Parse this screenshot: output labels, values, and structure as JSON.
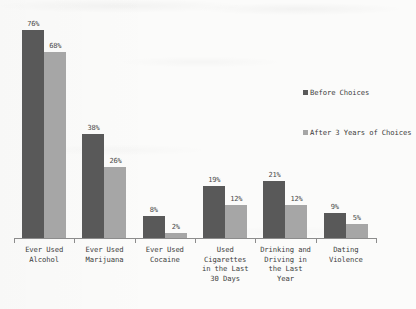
{
  "chart_data": {
    "type": "bar",
    "title": "",
    "subtitle": "",
    "xlabel": "",
    "ylabel": "",
    "ylim": [
      0,
      80
    ],
    "grid": false,
    "legend_position": "right",
    "value_suffix": "%",
    "categories": [
      "Ever Used\nAlcohol",
      "Ever Used\nMarijuana",
      "Ever Used\nCocaine",
      "Used\nCigarettes\nin the Last\n30 Days",
      "Drinking and\nDriving in\nthe Last\nYear",
      "Dating\nViolence"
    ],
    "series": [
      {
        "name": "Before Choices",
        "color": "#595959",
        "values": [
          76,
          38,
          8,
          19,
          21,
          9
        ],
        "labels": [
          "76%",
          "38%",
          "8%",
          "19%",
          "21%",
          "9%"
        ]
      },
      {
        "name": "After 3 Years of Choices",
        "color": "#a6a6a6",
        "values": [
          68,
          26,
          2,
          12,
          12,
          5
        ],
        "labels": [
          "68%",
          "26%",
          "2%",
          "12%",
          "12%",
          "5%"
        ]
      }
    ]
  },
  "axis": {
    "baseline_color": "#8c8c8c"
  }
}
